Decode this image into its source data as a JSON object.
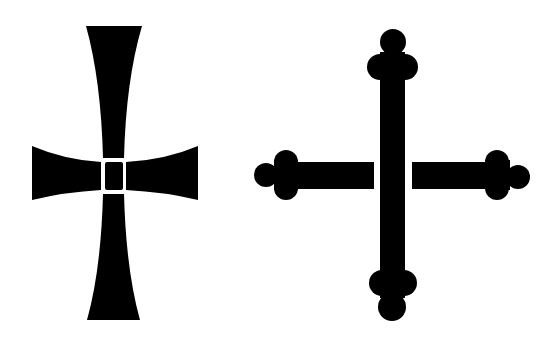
{
  "image": {
    "background": "#ffffff",
    "ink": "#000000",
    "figures": [
      {
        "id": "cross-pattee",
        "description": "Cross pattée with concave flared arms and an outlined center square"
      },
      {
        "id": "cross-bottony",
        "description": "Cross bottony (budded) with trefoil knob terminals; horizontal arms detached from vertical shaft"
      }
    ]
  }
}
